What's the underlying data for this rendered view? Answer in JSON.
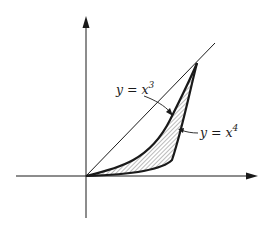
{
  "figure": {
    "axes": {
      "x_axis": {
        "label": "",
        "arrow": true
      },
      "y_axis": {
        "label": "",
        "arrow": true
      }
    },
    "curves": [
      {
        "name": "y = x^3",
        "label_base": "y = x",
        "label_exponent": "3",
        "style": "thick"
      },
      {
        "name": "y = x^4",
        "label_base": "y = x",
        "label_exponent": "4",
        "style": "thick"
      },
      {
        "name": "y = x",
        "label_base": "",
        "label_exponent": "",
        "style": "thin"
      }
    ],
    "shaded_region": {
      "between": [
        "y = x^3",
        "y = x^4"
      ],
      "fill": "hatched"
    },
    "colors": {
      "ink": "#1a1a1a",
      "background": "#ffffff"
    }
  },
  "labels": {
    "curve_x3": {
      "base": "y = x",
      "exp": "3"
    },
    "curve_x4": {
      "base": "y = x",
      "exp": "4"
    }
  }
}
